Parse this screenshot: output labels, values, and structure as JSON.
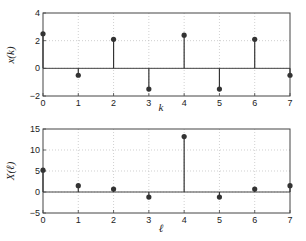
{
  "chart_data": [
    {
      "type": "stem",
      "title": "",
      "xlabel": "k",
      "ylabel": "x(k)",
      "x": [
        0,
        1,
        2,
        3,
        4,
        5,
        6,
        7
      ],
      "values": [
        2.5,
        -0.5,
        2.1,
        -1.5,
        2.4,
        -1.5,
        2.1,
        -0.5
      ],
      "xlim": [
        0,
        7
      ],
      "ylim": [
        -2,
        4
      ],
      "xticks": [
        "0",
        "1",
        "2",
        "3",
        "4",
        "5",
        "6",
        "7"
      ],
      "yticks": [
        "-2",
        "0",
        "2",
        "4"
      ],
      "grid": true
    },
    {
      "type": "stem",
      "title": "",
      "xlabel": "ℓ",
      "ylabel": "X(ℓ)",
      "x": [
        0,
        1,
        2,
        3,
        4,
        5,
        6,
        7
      ],
      "values": [
        5.2,
        1.5,
        0.7,
        -1.2,
        13.2,
        -1.2,
        0.7,
        1.5
      ],
      "xlim": [
        0,
        7
      ],
      "ylim": [
        -5,
        15
      ],
      "xticks": [
        "0",
        "1",
        "2",
        "3",
        "4",
        "5",
        "6",
        "7"
      ],
      "yticks": [
        "-5",
        "0",
        "5",
        "10",
        "15"
      ],
      "grid": true
    }
  ],
  "colors": {
    "stem": "#333333",
    "grid": "#bbbbbb",
    "axis": "#444444"
  }
}
